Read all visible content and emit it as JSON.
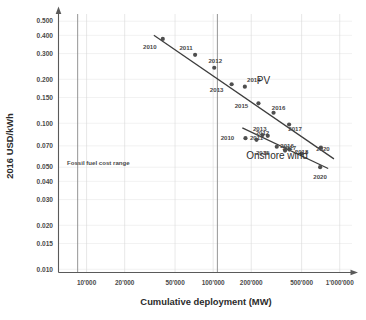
{
  "chart_data": {
    "type": "scatter",
    "title": "",
    "xlabel": "Cumulative deployment (MW)",
    "ylabel": "2016 USD/kWh",
    "xscale": "log",
    "yscale": "log",
    "xlim": [
      6000,
      1250000
    ],
    "ylim": [
      0.0095,
      0.56
    ],
    "grid": true,
    "legend_position": "inline-annotations",
    "xticks": [
      {
        "value": 10000,
        "label": "10'000"
      },
      {
        "value": 20000,
        "label": "20'000"
      },
      {
        "value": 50000,
        "label": "50'000"
      },
      {
        "value": 100000,
        "label": "100'000"
      },
      {
        "value": 200000,
        "label": "200'000"
      },
      {
        "value": 500000,
        "label": "500'000"
      },
      {
        "value": 1000000,
        "label": "1'000'000"
      }
    ],
    "yticks": [
      {
        "value": 0.5,
        "label": "0.500"
      },
      {
        "value": 0.4,
        "label": "0.400"
      },
      {
        "value": 0.3,
        "label": "0.300"
      },
      {
        "value": 0.2,
        "label": "0.200"
      },
      {
        "value": 0.15,
        "label": "0.150"
      },
      {
        "value": 0.1,
        "label": "0.100"
      },
      {
        "value": 0.07,
        "label": "0.070"
      },
      {
        "value": 0.05,
        "label": "0.050"
      },
      {
        "value": 0.04,
        "label": "0.040"
      },
      {
        "value": 0.03,
        "label": "0.030"
      },
      {
        "value": 0.02,
        "label": "0.020"
      },
      {
        "value": 0.015,
        "label": "0.015"
      },
      {
        "value": 0.01,
        "label": "0.010"
      }
    ],
    "annotations": [
      {
        "name": "fossil-fuel-cost-range",
        "text": "Fossil fuel cost range",
        "x": 7000,
        "y": 0.052
      },
      {
        "name": "series-label-pv",
        "text": "PV",
        "x": 250000,
        "y": 0.185
      },
      {
        "name": "series-label-onshore-wind",
        "text": "Onshore wind",
        "x": 320000,
        "y": 0.057
      }
    ],
    "series": [
      {
        "name": "PV",
        "label": "PV",
        "color": "#4f4f4f",
        "points": [
          {
            "year": "2010",
            "x": 40000,
            "y": 0.378,
            "label_dx": -13,
            "label_dy": 10
          },
          {
            "year": "2011",
            "x": 72000,
            "y": 0.294,
            "label_dx": -9,
            "label_dy": -5
          },
          {
            "year": "2012",
            "x": 102000,
            "y": 0.24,
            "label_dx": 1,
            "label_dy": -5
          },
          {
            "year": "2013",
            "x": 140000,
            "y": 0.185,
            "label_dx": -15,
            "label_dy": 8
          },
          {
            "year": "2014",
            "x": 178000,
            "y": 0.178,
            "label_dx": 9,
            "label_dy": -5
          },
          {
            "year": "2015",
            "x": 228000,
            "y": 0.137,
            "label_dx": -17,
            "label_dy": 5
          },
          {
            "year": "2016",
            "x": 300000,
            "y": 0.118,
            "label_dx": 5,
            "label_dy": -3
          },
          {
            "year": "2017",
            "x": 398000,
            "y": 0.098,
            "label_dx": 6,
            "label_dy": 6
          },
          {
            "year": "2020",
            "x": 710000,
            "y": 0.068,
            "label_dx": 2,
            "label_dy": 3
          }
        ],
        "trend": {
          "x1": 34000,
          "y1": 0.4,
          "x2": 900000,
          "y2": 0.057
        }
      },
      {
        "name": "Onshore wind",
        "label": "Onshore wind",
        "color": "#4f4f4f",
        "points": [
          {
            "year": "2010",
            "x": 180000,
            "y": 0.079,
            "label_dx": -18,
            "label_dy": 2
          },
          {
            "year": "2011",
            "x": 220000,
            "y": 0.077,
            "label_dx": 0,
            "label_dy": 0
          },
          {
            "year": "2012",
            "x": 245000,
            "y": 0.083,
            "label_dx": 0,
            "label_dy": 0
          },
          {
            "year": "2013",
            "x": 270000,
            "y": 0.082,
            "label_dx": -8,
            "label_dy": -5
          },
          {
            "year": "2015",
            "x": 318000,
            "y": 0.069,
            "label_dx": -14,
            "label_dy": 8
          },
          {
            "year": "2016",
            "x": 370000,
            "y": 0.065,
            "label_dx": 2,
            "label_dy": -3
          },
          {
            "year": "2017",
            "x": 400000,
            "y": 0.066,
            "label_dx": 0,
            "label_dy": 0
          },
          {
            "year": "2018",
            "x": 500000,
            "y": 0.062,
            "label_dx": 0,
            "label_dy": 0
          },
          {
            "year": "2020",
            "x": 700000,
            "y": 0.05,
            "label_dx": 0,
            "label_dy": 12
          }
        ],
        "trend": {
          "x1": 170000,
          "y1": 0.093,
          "x2": 810000,
          "y2": 0.049
        }
      }
    ],
    "reference_lines": [
      {
        "name": "fossil-band-left",
        "x": 8500
      },
      {
        "name": "fossil-band-right",
        "x": 108000
      }
    ]
  }
}
